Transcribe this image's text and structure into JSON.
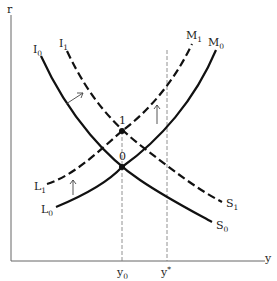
{
  "diagram": {
    "type": "IS-LM style macroeconomic diagram",
    "axes": {
      "y_axis_label": "r",
      "x_axis_label": "y"
    },
    "x_markers": [
      {
        "label": "y",
        "subscript": "0"
      },
      {
        "label": "y",
        "superscript": "*"
      }
    ],
    "curves": [
      {
        "id": "I0S0",
        "start_label": "I",
        "start_sub": "0",
        "end_label": "S",
        "end_sub": "0",
        "style": "solid"
      },
      {
        "id": "I1S1",
        "start_label": "I",
        "start_sub": "1",
        "end_label": "S",
        "end_sub": "1",
        "style": "dashed"
      },
      {
        "id": "L0M0",
        "start_label": "L",
        "start_sub": "0",
        "end_label": "M",
        "end_sub": "0",
        "style": "solid"
      },
      {
        "id": "L1M1",
        "start_label": "L",
        "start_sub": "1",
        "end_label": "M",
        "end_sub": "1",
        "style": "dashed"
      }
    ],
    "points": [
      {
        "label": "1",
        "desc": "intersection of I1S1 and L1M1"
      },
      {
        "label": "0",
        "desc": "intersection of I0S0 and L0M0"
      }
    ],
    "arrows": [
      {
        "desc": "shift I0S0 to I1S1"
      },
      {
        "desc": "shift L0M0 up to L1M1 (left)"
      },
      {
        "desc": "shift L0M0 up to L1M1 (right)"
      }
    ],
    "colors": {
      "line": "#111111",
      "axis": "#555555",
      "guide": "#666666"
    }
  }
}
